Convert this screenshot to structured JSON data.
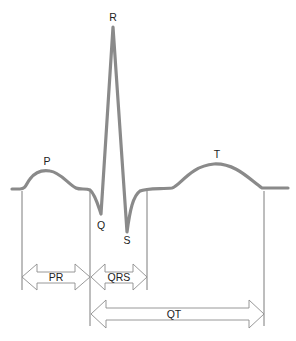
{
  "diagram": {
    "type": "ecg-waveform",
    "wave_labels": {
      "p": "P",
      "q": "Q",
      "r": "R",
      "s": "S",
      "t": "T"
    },
    "interval_labels": {
      "pr": "PR",
      "qrs": "QRS",
      "qt": "QT"
    },
    "colors": {
      "waveform": "#8a8a8a",
      "guides": "#5a5a5a",
      "arrow_outline": "#8c8c8c",
      "text": "#222222",
      "background": "#ffffff"
    }
  }
}
